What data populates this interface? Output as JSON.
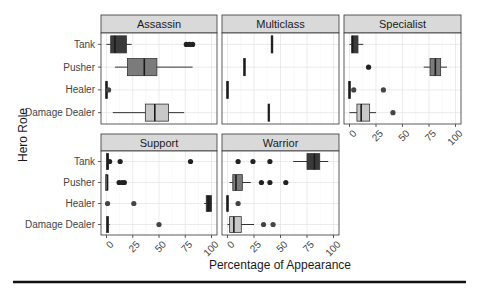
{
  "chart_data": {
    "type": "boxplot",
    "layout": "facet_wrap",
    "xlabel": "Percentage of Appearance",
    "ylabel": "Hero Role",
    "xlim": [
      0,
      100
    ],
    "x_ticks": [
      0,
      25,
      50,
      75,
      100
    ],
    "categories": [
      "Tank",
      "Pusher",
      "Healer",
      "Damage Dealer"
    ],
    "grid": true,
    "legend": "none",
    "fill_colors": {
      "Tank": "#3a3a3a",
      "Pusher": "#7b7b7b",
      "Healer": "#262626",
      "Damage Dealer": "#c8c8c8"
    },
    "panels": [
      {
        "name": "Assassin",
        "boxes": [
          {
            "role": "Tank",
            "min": 0,
            "q1": 4,
            "median": 8,
            "q3": 19,
            "max": 24,
            "outliers": [
              76,
              79,
              82
            ]
          },
          {
            "role": "Pusher",
            "min": 8,
            "q1": 20,
            "median": 36,
            "q3": 48,
            "max": 82,
            "outliers": []
          },
          {
            "role": "Healer",
            "min": 0,
            "q1": 0,
            "median": 0,
            "q3": 1,
            "max": 1,
            "outliers": [
              2
            ]
          },
          {
            "role": "Damage Dealer",
            "min": 6,
            "q1": 37,
            "median": 46,
            "q3": 59,
            "max": 74,
            "outliers": []
          }
        ]
      },
      {
        "name": "Multiclass",
        "boxes": [
          {
            "role": "Tank",
            "min": 42,
            "q1": 42,
            "median": 42,
            "q3": 42,
            "max": 42,
            "outliers": []
          },
          {
            "role": "Pusher",
            "min": 16,
            "q1": 16,
            "median": 16,
            "q3": 16,
            "max": 16,
            "outliers": []
          },
          {
            "role": "Healer",
            "min": 0,
            "q1": 0,
            "median": 0,
            "q3": 0,
            "max": 0,
            "outliers": []
          },
          {
            "role": "Damage Dealer",
            "min": 39,
            "q1": 39,
            "median": 39,
            "q3": 39,
            "max": 39,
            "outliers": []
          }
        ]
      },
      {
        "name": "Specialist",
        "boxes": [
          {
            "role": "Tank",
            "min": 0,
            "q1": 2,
            "median": 3,
            "q3": 8,
            "max": 13,
            "outliers": []
          },
          {
            "role": "Pusher",
            "min": 70,
            "q1": 76,
            "median": 81,
            "q3": 86,
            "max": 92,
            "outliers": [
              18
            ]
          },
          {
            "role": "Healer",
            "min": 0,
            "q1": 0,
            "median": 0,
            "q3": 1,
            "max": 1,
            "outliers": [
              4,
              32
            ]
          },
          {
            "role": "Damage Dealer",
            "min": 0,
            "q1": 7,
            "median": 11,
            "q3": 19,
            "max": 25,
            "outliers": [
              41
            ]
          }
        ]
      },
      {
        "name": "Support",
        "boxes": [
          {
            "role": "Tank",
            "min": 0,
            "q1": 0,
            "median": 1,
            "q3": 2,
            "max": 2,
            "outliers": [
              3,
              13,
              80
            ]
          },
          {
            "role": "Pusher",
            "min": 0,
            "q1": 0,
            "median": 1,
            "q3": 1,
            "max": 1,
            "outliers": [
              12,
              15,
              17
            ]
          },
          {
            "role": "Healer",
            "min": 93,
            "q1": 95,
            "median": 97,
            "q3": 100,
            "max": 100,
            "outliers": [
              1,
              26
            ]
          },
          {
            "role": "Damage Dealer",
            "min": 0,
            "q1": 0,
            "median": 1,
            "q3": 2,
            "max": 3,
            "outliers": [
              50
            ]
          }
        ]
      },
      {
        "name": "Warrior",
        "boxes": [
          {
            "role": "Tank",
            "min": 62,
            "q1": 75,
            "median": 82,
            "q3": 87,
            "max": 95,
            "outliers": [
              10,
              24,
              40
            ]
          },
          {
            "role": "Pusher",
            "min": 2,
            "q1": 5,
            "median": 8,
            "q3": 14,
            "max": 22,
            "outliers": [
              32,
              40,
              55
            ]
          },
          {
            "role": "Healer",
            "min": 0,
            "q1": 0,
            "median": 0,
            "q3": 0,
            "max": 0,
            "outliers": [
              10
            ]
          },
          {
            "role": "Damage Dealer",
            "min": 0,
            "q1": 2,
            "median": 6,
            "q3": 13,
            "max": 25,
            "outliers": [
              34,
              43
            ]
          }
        ]
      }
    ]
  }
}
